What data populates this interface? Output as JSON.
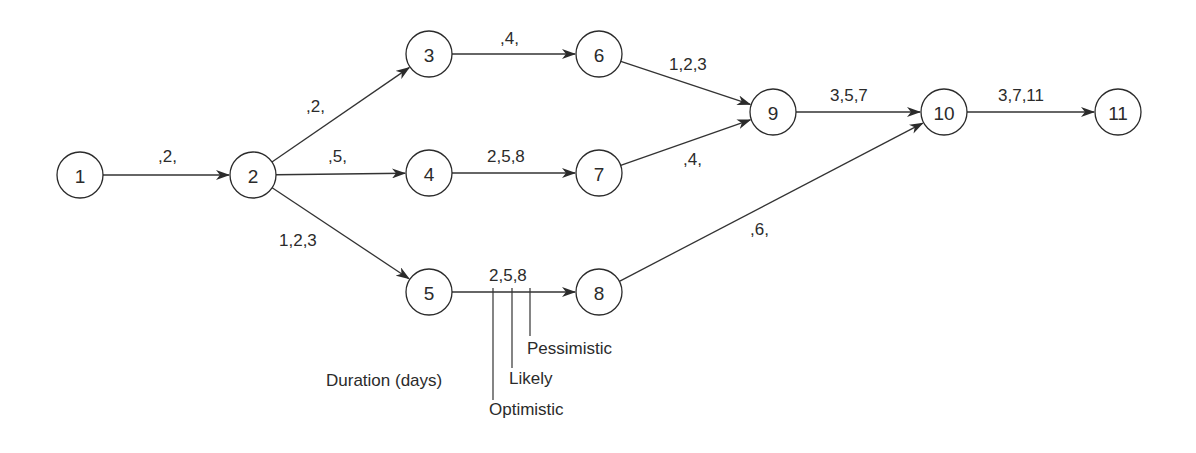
{
  "diagram": {
    "type": "PERT network",
    "nodes": [
      {
        "id": "1",
        "label": "1",
        "x": 80,
        "y": 175
      },
      {
        "id": "2",
        "label": "2",
        "x": 253,
        "y": 175
      },
      {
        "id": "3",
        "label": "3",
        "x": 429,
        "y": 54
      },
      {
        "id": "4",
        "label": "4",
        "x": 429,
        "y": 173
      },
      {
        "id": "5",
        "label": "5",
        "x": 429,
        "y": 292
      },
      {
        "id": "6",
        "label": "6",
        "x": 599,
        "y": 54
      },
      {
        "id": "7",
        "label": "7",
        "x": 599,
        "y": 173
      },
      {
        "id": "8",
        "label": "8",
        "x": 599,
        "y": 292
      },
      {
        "id": "9",
        "label": "9",
        "x": 773,
        "y": 112
      },
      {
        "id": "10",
        "label": "10",
        "x": 944,
        "y": 112
      },
      {
        "id": "11",
        "label": "11",
        "x": 1118,
        "y": 112
      }
    ],
    "edges": [
      {
        "from": "1",
        "to": "2",
        "label": ",2,",
        "lx": 158,
        "ly": 162
      },
      {
        "from": "2",
        "to": "3",
        "label": ",2,",
        "lx": 306,
        "ly": 112
      },
      {
        "from": "2",
        "to": "4",
        "label": ",5,",
        "lx": 328,
        "ly": 162
      },
      {
        "from": "2",
        "to": "5",
        "label": "1,2,3",
        "lx": 279,
        "ly": 246
      },
      {
        "from": "3",
        "to": "6",
        "label": ",4,",
        "lx": 500,
        "ly": 44
      },
      {
        "from": "4",
        "to": "7",
        "label": "2,5,8",
        "lx": 487,
        "ly": 162
      },
      {
        "from": "5",
        "to": "8",
        "label": "2,5,8",
        "lx": 489,
        "ly": 281
      },
      {
        "from": "6",
        "to": "9",
        "label": "1,2,3",
        "lx": 669,
        "ly": 70
      },
      {
        "from": "7",
        "to": "9",
        "label": ",4,",
        "lx": 683,
        "ly": 165
      },
      {
        "from": "8",
        "to": "10",
        "label": ",6,",
        "lx": 750,
        "ly": 235
      },
      {
        "from": "9",
        "to": "10",
        "label": "3,5,7",
        "lx": 830,
        "ly": 101
      },
      {
        "from": "10",
        "to": "11",
        "label": "3,7,11",
        "lx": 998,
        "ly": 101
      }
    ],
    "legend": {
      "title": "Duration (days)",
      "optimistic": "Optimistic",
      "likely": "Likely",
      "pessimistic": "Pessimistic"
    }
  }
}
